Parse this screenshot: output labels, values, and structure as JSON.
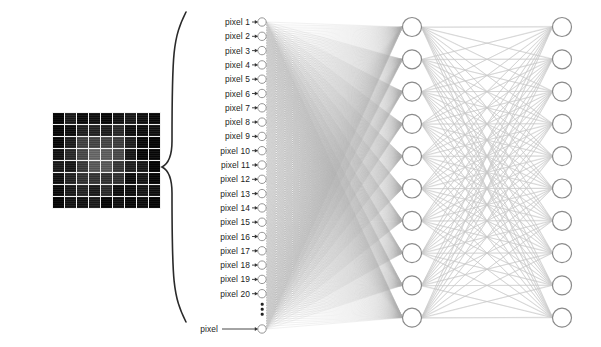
{
  "figure": {
    "width": 601,
    "height": 347,
    "background": "#ffffff"
  },
  "colors": {
    "ink": "#1c1c1c",
    "node_stroke": "#8a8a8a",
    "node_fill": "#ffffff",
    "edge_input": "#b4b4b4",
    "edge_hidden": "#c9c9c9",
    "brace": "#2a2a2a",
    "arrow": "#333333",
    "grid_cell_dark": "#1a1a1a",
    "grid_line": "#f2f2f2"
  },
  "input_image": {
    "name": "pixel-grid-image",
    "columns": 9,
    "rows": 8,
    "left": 52,
    "top": 112,
    "cell_size": 10.6,
    "gap": 1.4,
    "brightness_rows": [
      [
        0.1,
        0.12,
        0.13,
        0.14,
        0.13,
        0.12,
        0.11,
        0.1,
        0.09
      ],
      [
        0.11,
        0.16,
        0.24,
        0.3,
        0.28,
        0.22,
        0.15,
        0.11,
        0.09
      ],
      [
        0.12,
        0.22,
        0.38,
        0.48,
        0.46,
        0.34,
        0.2,
        0.12,
        0.1
      ],
      [
        0.14,
        0.28,
        0.5,
        0.62,
        0.6,
        0.44,
        0.24,
        0.14,
        0.1
      ],
      [
        0.13,
        0.26,
        0.46,
        0.58,
        0.55,
        0.4,
        0.22,
        0.13,
        0.1
      ],
      [
        0.12,
        0.2,
        0.32,
        0.4,
        0.38,
        0.28,
        0.18,
        0.11,
        0.09
      ],
      [
        0.11,
        0.15,
        0.2,
        0.24,
        0.22,
        0.18,
        0.13,
        0.1,
        0.09
      ],
      [
        0.1,
        0.11,
        0.12,
        0.13,
        0.12,
        0.11,
        0.1,
        0.09,
        0.09
      ]
    ]
  },
  "brace": {
    "name": "flatten-brace",
    "x_tip": 186,
    "x_back": 172,
    "y_top": 12,
    "y_bottom": 322,
    "y_mid": 167
  },
  "input_layer": {
    "name": "input-layer",
    "node_x": 262,
    "node_radius": 4.2,
    "label_right": 250,
    "arrow_start": 252,
    "arrow_end": 258,
    "first_y": 22,
    "spacing": 14.3,
    "labels": [
      "pixel 1",
      "pixel 2",
      "pixel 3",
      "pixel 4",
      "pixel 5",
      "pixel 6",
      "pixel 7",
      "pixel 8",
      "pixel 9",
      "pixel 10",
      "pixel 11",
      "pixel 12",
      "pixel 13",
      "pixel 14",
      "pixel 15",
      "pixel 16",
      "pixel 17",
      "pixel 18",
      "pixel 19",
      "pixel 20"
    ],
    "ellipsis_label": "⋮",
    "ellipsis_y": 309,
    "last_label": "pixel",
    "last_label_y": 329,
    "last_arrow_start": 222,
    "count_drawn": 21
  },
  "hidden_layer": {
    "name": "hidden-layer",
    "node_x": 412,
    "node_radius": 9.5,
    "first_y": 27,
    "spacing": 32.3,
    "count": 10
  },
  "output_layer": {
    "name": "output-layer",
    "node_x": 562,
    "node_radius": 9.5,
    "first_y": 27,
    "spacing": 32.3,
    "count": 10
  }
}
